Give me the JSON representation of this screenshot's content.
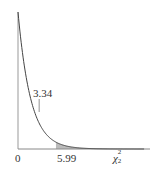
{
  "chart_data": {
    "type": "line",
    "title": "",
    "xlabel": "χ²₂",
    "ylabel": "",
    "x_ticks": [
      {
        "value": 0,
        "label": "0"
      },
      {
        "value": 5.99,
        "label": "5.99"
      }
    ],
    "annotations": [
      {
        "x": 3.34,
        "label": "3.34",
        "type": "marker-line"
      }
    ],
    "shaded_region": {
      "from": 5.99,
      "to": 20,
      "meaning": "upper tail area (0.05)"
    },
    "series": [
      {
        "name": "chi-squared df=2 density",
        "x": [
          0,
          1,
          2,
          3,
          3.34,
          4,
          5,
          5.99,
          7,
          8,
          10,
          12,
          15,
          18,
          20
        ],
        "y": [
          0.5,
          0.303,
          0.184,
          0.112,
          0.094,
          0.068,
          0.041,
          0.025,
          0.015,
          0.009,
          0.003,
          0.001,
          0.0003,
          0.0001,
          2e-05
        ]
      }
    ],
    "xlim": [
      0,
      20
    ],
    "ylim": [
      0,
      0.5
    ],
    "grid": false,
    "legend": "none"
  },
  "labels": {
    "origin": "0",
    "critical_value": "5.99",
    "marker_value": "3.34",
    "axis_symbol": "χ",
    "axis_sup": "2",
    "axis_sub": "2"
  },
  "colors": {
    "curve": "#444444",
    "axis": "#888888",
    "shade": "#bbbbbb"
  }
}
